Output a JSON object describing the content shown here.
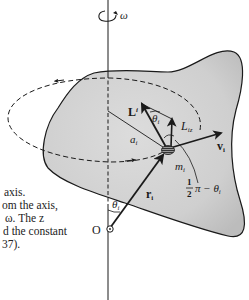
{
  "figure": {
    "colors": {
      "body_fill": "#d2d2d2",
      "body_shade": "#bdbdbd",
      "ink": "#1a1a1a",
      "background": "#ffffff"
    },
    "labels": {
      "omega": "ω",
      "L_i_main": "L",
      "L_i_sub": "i",
      "theta_top_main": "θ",
      "theta_top_sub": "i",
      "L_iz_main": "L",
      "L_iz_sub": "iz",
      "a_i_main": "a",
      "a_i_sub": "i",
      "v_i_main": "v",
      "v_i_sub": "i",
      "m_i_main": "m",
      "m_i_sub": "i",
      "r_i_main": "r",
      "r_i_sub": "i",
      "theta_bottom_main": "θ",
      "theta_bottom_sub": "i",
      "angle_num": "1",
      "angle_den": "2",
      "angle_rest": "π − θ",
      "angle_sub": "i",
      "origin": "O"
    }
  },
  "text_fragments": [
    " axis.",
    "om the axis,",
    "ω.  The z",
    "d the constant",
    "37)."
  ]
}
